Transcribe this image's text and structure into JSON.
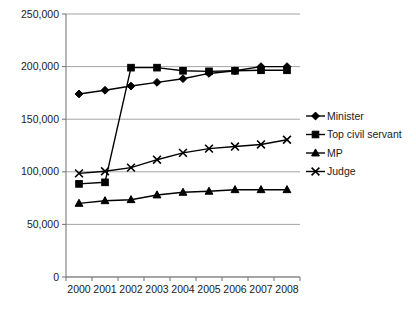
{
  "chart_data": {
    "type": "line",
    "title": "",
    "subtitle": "",
    "xlabel": "",
    "ylabel": "",
    "categories": [
      "2000",
      "2001",
      "2002",
      "2003",
      "2004",
      "2005",
      "2006",
      "2007",
      "2008"
    ],
    "x": [
      2000,
      2001,
      2002,
      2003,
      2004,
      2005,
      2006,
      2007,
      2008
    ],
    "ylim": [
      0,
      250000
    ],
    "ytick_values": [
      0,
      50000,
      100000,
      150000,
      200000,
      250000
    ],
    "ytick_labels": [
      "0",
      "50,000",
      "100,000",
      "150,000",
      "200,000",
      "250,000"
    ],
    "grid": true,
    "legend_position": "right",
    "series": [
      {
        "name": "Minister",
        "marker": "diamond",
        "values": [
          174000,
          177500,
          181500,
          185000,
          188500,
          193500,
          196000,
          200000,
          200000
        ]
      },
      {
        "name": "Top civil servant",
        "marker": "square",
        "values": [
          88500,
          90000,
          199000,
          199000,
          196000,
          195500,
          196000,
          196500,
          196500
        ]
      },
      {
        "name": "MP",
        "marker": "triangle",
        "values": [
          70000,
          72500,
          73500,
          78000,
          80500,
          81500,
          83000,
          83000,
          83000
        ]
      },
      {
        "name": "Judge",
        "marker": "cross",
        "values": [
          98500,
          100500,
          104000,
          111500,
          118000,
          122000,
          124000,
          126000,
          130500
        ]
      }
    ]
  },
  "legend": {
    "entries": [
      {
        "label": "Minister",
        "marker": "diamond"
      },
      {
        "label": "Top civil servant",
        "marker": "square"
      },
      {
        "label": "MP",
        "marker": "triangle"
      },
      {
        "label": "Judge",
        "marker": "cross"
      }
    ]
  },
  "axes": {
    "y": {
      "labels": [
        "250,000",
        "200,000",
        "150,000",
        "100,000",
        "50,000",
        "0"
      ]
    },
    "x": {
      "labels": [
        "2000",
        "2001",
        "2002",
        "2003",
        "2004",
        "2005",
        "2006",
        "2007",
        "2008"
      ]
    }
  },
  "artifacts": {
    "clipped_header_text": "———"
  },
  "colors": {
    "series": "#000000",
    "grid": "#9a9a9a",
    "axis": "#7a7a7a",
    "text": "#1a1a1a",
    "background": "#ffffff"
  }
}
